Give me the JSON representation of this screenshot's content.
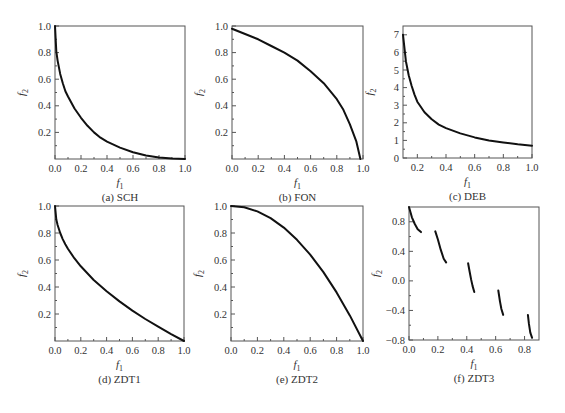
{
  "figure": {
    "background": "#ffffff",
    "line_color": "#111111",
    "frame_color": "#555555"
  },
  "chart_data": [
    {
      "id": "a",
      "type": "line",
      "title": "(a) SCH",
      "xlabel": "f1",
      "ylabel": "f2",
      "xlim": [
        0.0,
        1.0
      ],
      "ylim": [
        0.0,
        1.0
      ],
      "xticks": [
        0.0,
        0.2,
        0.4,
        0.6,
        0.8,
        1.0
      ],
      "xtick_labels": [
        "0.0",
        "0.2",
        "0.4",
        "0.6",
        "0.8",
        "1.0"
      ],
      "yticks": [
        0.2,
        0.4,
        0.6,
        0.8,
        1.0
      ],
      "ytick_labels": [
        "0.2",
        "0.4",
        "0.6",
        "0.8",
        "1.0"
      ],
      "grid": false,
      "frame": {
        "x": 55,
        "y": 26,
        "w": 130,
        "h": 133
      },
      "series": [
        {
          "name": "Pareto front",
          "segments": [
            [
              [
                0.0,
                1.0
              ],
              [
                0.01,
                0.81
              ],
              [
                0.02,
                0.74
              ],
              [
                0.04,
                0.64
              ],
              [
                0.06,
                0.57
              ],
              [
                0.08,
                0.51
              ],
              [
                0.1,
                0.47
              ],
              [
                0.15,
                0.38
              ],
              [
                0.2,
                0.31
              ],
              [
                0.25,
                0.25
              ],
              [
                0.3,
                0.2
              ],
              [
                0.35,
                0.16
              ],
              [
                0.4,
                0.13
              ],
              [
                0.5,
                0.086
              ],
              [
                0.6,
                0.051
              ],
              [
                0.7,
                0.026
              ],
              [
                0.8,
                0.011
              ],
              [
                0.9,
                0.003
              ],
              [
                1.0,
                0.0
              ]
            ]
          ]
        }
      ]
    },
    {
      "id": "b",
      "type": "line",
      "title": "(b) FON",
      "xlabel": "f1",
      "ylabel": "f2",
      "xlim": [
        0.0,
        1.0
      ],
      "ylim": [
        0.0,
        1.0
      ],
      "xticks": [
        0.0,
        0.2,
        0.4,
        0.6,
        0.8,
        1.0
      ],
      "xtick_labels": [
        "0.0",
        "0.2",
        "0.4",
        "0.6",
        "0.8",
        "1.0"
      ],
      "yticks": [
        0.2,
        0.4,
        0.6,
        0.8,
        1.0
      ],
      "ytick_labels": [
        "0.2",
        "0.4",
        "0.6",
        "0.8",
        "1.0"
      ],
      "grid": false,
      "frame": {
        "x": 232,
        "y": 26,
        "w": 131,
        "h": 133
      },
      "series": [
        {
          "name": "Pareto front",
          "segments": [
            [
              [
                0.0,
                0.98
              ],
              [
                0.1,
                0.94
              ],
              [
                0.2,
                0.9
              ],
              [
                0.3,
                0.85
              ],
              [
                0.4,
                0.8
              ],
              [
                0.5,
                0.74
              ],
              [
                0.6,
                0.66
              ],
              [
                0.7,
                0.57
              ],
              [
                0.8,
                0.45
              ],
              [
                0.85,
                0.37
              ],
              [
                0.9,
                0.26
              ],
              [
                0.95,
                0.13
              ],
              [
                0.98,
                0.0
              ]
            ]
          ]
        }
      ]
    },
    {
      "id": "c",
      "type": "line",
      "title": "(c) DEB",
      "xlabel": "f1",
      "ylabel": "f2",
      "xlim": [
        0.1,
        1.0
      ],
      "ylim": [
        0,
        7.5
      ],
      "xticks": [
        0.2,
        0.4,
        0.6,
        0.8,
        1.0
      ],
      "xtick_labels": [
        "0.2",
        "0.4",
        "0.6",
        "0.8",
        "1.0"
      ],
      "yticks": [
        0,
        1,
        2,
        3,
        4,
        5,
        6,
        7
      ],
      "ytick_labels": [
        "0",
        "1",
        "2",
        "3",
        "4",
        "5",
        "6",
        "7"
      ],
      "grid": false,
      "frame": {
        "x": 403,
        "y": 26,
        "w": 129,
        "h": 132
      },
      "series": [
        {
          "name": "Pareto front",
          "segments": [
            [
              [
                0.1,
                7.0
              ],
              [
                0.12,
                5.5
              ],
              [
                0.14,
                4.7
              ],
              [
                0.16,
                4.1
              ],
              [
                0.18,
                3.6
              ],
              [
                0.2,
                3.2
              ],
              [
                0.25,
                2.6
              ],
              [
                0.3,
                2.2
              ],
              [
                0.35,
                1.9
              ],
              [
                0.4,
                1.7
              ],
              [
                0.5,
                1.4
              ],
              [
                0.6,
                1.17
              ],
              [
                0.7,
                1.0
              ],
              [
                0.8,
                0.88
              ],
              [
                0.9,
                0.78
              ],
              [
                1.0,
                0.7
              ]
            ]
          ]
        }
      ]
    },
    {
      "id": "d",
      "type": "line",
      "title": "(d) ZDT1",
      "xlabel": "f1",
      "ylabel": "f2",
      "xlim": [
        0.0,
        1.0
      ],
      "ylim": [
        0.0,
        1.0
      ],
      "xticks": [
        0.0,
        0.2,
        0.4,
        0.6,
        0.8,
        1.0
      ],
      "xtick_labels": [
        "0.0",
        "0.2",
        "0.4",
        "0.6",
        "0.8",
        "1.0"
      ],
      "yticks": [
        0.2,
        0.4,
        0.6,
        0.8,
        1.0
      ],
      "ytick_labels": [
        "0.2",
        "0.4",
        "0.6",
        "0.8",
        "1.0"
      ],
      "grid": false,
      "frame": {
        "x": 55,
        "y": 206,
        "w": 129,
        "h": 135
      },
      "series": [
        {
          "name": "Pareto front",
          "segments": [
            [
              [
                0.0,
                1.0
              ],
              [
                0.01,
                0.9
              ],
              [
                0.02,
                0.859
              ],
              [
                0.04,
                0.8
              ],
              [
                0.06,
                0.755
              ],
              [
                0.08,
                0.717
              ],
              [
                0.1,
                0.684
              ],
              [
                0.15,
                0.613
              ],
              [
                0.2,
                0.553
              ],
              [
                0.3,
                0.452
              ],
              [
                0.4,
                0.368
              ],
              [
                0.5,
                0.293
              ],
              [
                0.6,
                0.225
              ],
              [
                0.7,
                0.163
              ],
              [
                0.8,
                0.106
              ],
              [
                0.9,
                0.051
              ],
              [
                1.0,
                0.0
              ]
            ]
          ]
        }
      ]
    },
    {
      "id": "e",
      "type": "line",
      "title": "(e) ZDT2",
      "xlabel": "f1",
      "ylabel": "f2",
      "xlim": [
        0.0,
        1.0
      ],
      "ylim": [
        0.0,
        1.0
      ],
      "xticks": [
        0.0,
        0.2,
        0.4,
        0.6,
        0.8,
        1.0
      ],
      "xtick_labels": [
        "0.0",
        "0.2",
        "0.4",
        "0.6",
        "0.8",
        "1.0"
      ],
      "yticks": [
        0.2,
        0.4,
        0.6,
        0.8,
        1.0
      ],
      "ytick_labels": [
        "0.2",
        "0.4",
        "0.6",
        "0.8",
        "1.0"
      ],
      "grid": false,
      "frame": {
        "x": 231,
        "y": 206,
        "w": 132,
        "h": 135
      },
      "series": [
        {
          "name": "Pareto front",
          "segments": [
            [
              [
                0.0,
                1.0
              ],
              [
                0.1,
                0.99
              ],
              [
                0.2,
                0.96
              ],
              [
                0.3,
                0.91
              ],
              [
                0.4,
                0.84
              ],
              [
                0.5,
                0.75
              ],
              [
                0.6,
                0.64
              ],
              [
                0.7,
                0.51
              ],
              [
                0.8,
                0.36
              ],
              [
                0.9,
                0.19
              ],
              [
                1.0,
                0.0
              ]
            ]
          ]
        }
      ]
    },
    {
      "id": "f",
      "type": "line",
      "title": "(f) ZDT3",
      "xlabel": "f1",
      "ylabel": "f2",
      "xlim": [
        0.0,
        0.9
      ],
      "ylim": [
        -0.8,
        1.0
      ],
      "xticks": [
        0.0,
        0.2,
        0.4,
        0.6,
        0.8
      ],
      "xtick_labels": [
        "0.0",
        "0.2",
        "0.4",
        "0.6",
        "0.8"
      ],
      "yticks": [
        -0.8,
        -0.4,
        0.0,
        0.4,
        0.8
      ],
      "ytick_labels": [
        "−0.8",
        "−0.4",
        "0.0",
        "0.4",
        "0.8"
      ],
      "grid": false,
      "frame": {
        "x": 409,
        "y": 207,
        "w": 130,
        "h": 133
      },
      "series": [
        {
          "name": "Pareto front (disconnected)",
          "segments": [
            [
              [
                0.0,
                1.0
              ],
              [
                0.02,
                0.86
              ],
              [
                0.04,
                0.77
              ],
              [
                0.06,
                0.7
              ],
              [
                0.083,
                0.66
              ]
            ],
            [
              [
                0.182,
                0.67
              ],
              [
                0.2,
                0.56
              ],
              [
                0.22,
                0.42
              ],
              [
                0.24,
                0.3
              ],
              [
                0.257,
                0.25
              ]
            ],
            [
              [
                0.409,
                0.24
              ],
              [
                0.42,
                0.12
              ],
              [
                0.43,
                0.02
              ],
              [
                0.44,
                -0.07
              ],
              [
                0.452,
                -0.15
              ]
            ],
            [
              [
                0.618,
                -0.13
              ],
              [
                0.63,
                -0.28
              ],
              [
                0.64,
                -0.38
              ],
              [
                0.652,
                -0.46
              ]
            ],
            [
              [
                0.823,
                -0.46
              ],
              [
                0.83,
                -0.58
              ],
              [
                0.84,
                -0.7
              ],
              [
                0.852,
                -0.77
              ]
            ]
          ]
        }
      ]
    }
  ]
}
